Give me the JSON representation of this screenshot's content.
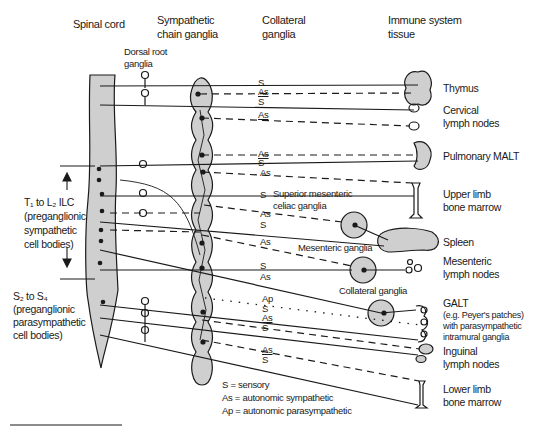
{
  "headers": {
    "spinal_cord": "Spinal cord",
    "sympathetic_chain": [
      "Sympathetic",
      "chain ganglia"
    ],
    "collateral": [
      "Collateral",
      "ganglia"
    ],
    "immune": [
      "Immune system",
      "tissue"
    ],
    "dorsal_root": [
      "Dorsal root",
      "ganglia"
    ]
  },
  "left_labels": {
    "thoracolumbar": [
      "T₁ to L₂ ILC",
      "(preganglionic",
      "sympathetic",
      "cell bodies)"
    ],
    "sacral": [
      "S₂ to S₄",
      "(preganglionic",
      "parasympathetic",
      "cell bodies)"
    ]
  },
  "ganglia_labels": {
    "superior_mesenteric": [
      "Superior mesenteric",
      "celiac ganglia"
    ],
    "mesenteric": "Mesenteric ganglia",
    "collateral": "Collateral ganglia"
  },
  "targets": [
    {
      "name": "Thymus",
      "lines": [
        "Thymus"
      ]
    },
    {
      "name": "Cervical lymph nodes",
      "lines": [
        "Cervical",
        "lymph nodes"
      ]
    },
    {
      "name": "Pulmonary MALT",
      "lines": [
        "Pulmonary MALT"
      ]
    },
    {
      "name": "Upper limb bone marrow",
      "lines": [
        "Upper limb",
        "bone marrow"
      ]
    },
    {
      "name": "Spleen",
      "lines": [
        "Spleen"
      ]
    },
    {
      "name": "Mesenteric lymph nodes",
      "lines": [
        "Mesenteric",
        "lymph nodes"
      ]
    },
    {
      "name": "GALT",
      "lines": [
        "GALT",
        "(e.g. Peyer's patches)",
        "with parasympathetic",
        "intramural ganglia"
      ]
    },
    {
      "name": "Inguinal lymph nodes",
      "lines": [
        "Inguinal",
        "lymph nodes"
      ]
    },
    {
      "name": "Lower limb bone marrow",
      "lines": [
        "Lower limb",
        "bone marrow"
      ]
    }
  ],
  "fiber_tags": [
    "S",
    "As",
    "S",
    "As",
    "As",
    "S",
    "As",
    "S",
    "As",
    "S",
    "As",
    "S",
    "As",
    "Ap",
    "S",
    "As",
    "S",
    "As",
    "S"
  ],
  "legend": [
    {
      "key": "S",
      "text": "S  = sensory"
    },
    {
      "key": "As",
      "text": "As = autonomic sympathetic"
    },
    {
      "key": "Ap",
      "text": "Ap = autonomic parasympathetic"
    }
  ],
  "colors": {
    "fill": "#cfcfcf",
    "stroke": "#1a1a1a",
    "background": "#ffffff"
  }
}
